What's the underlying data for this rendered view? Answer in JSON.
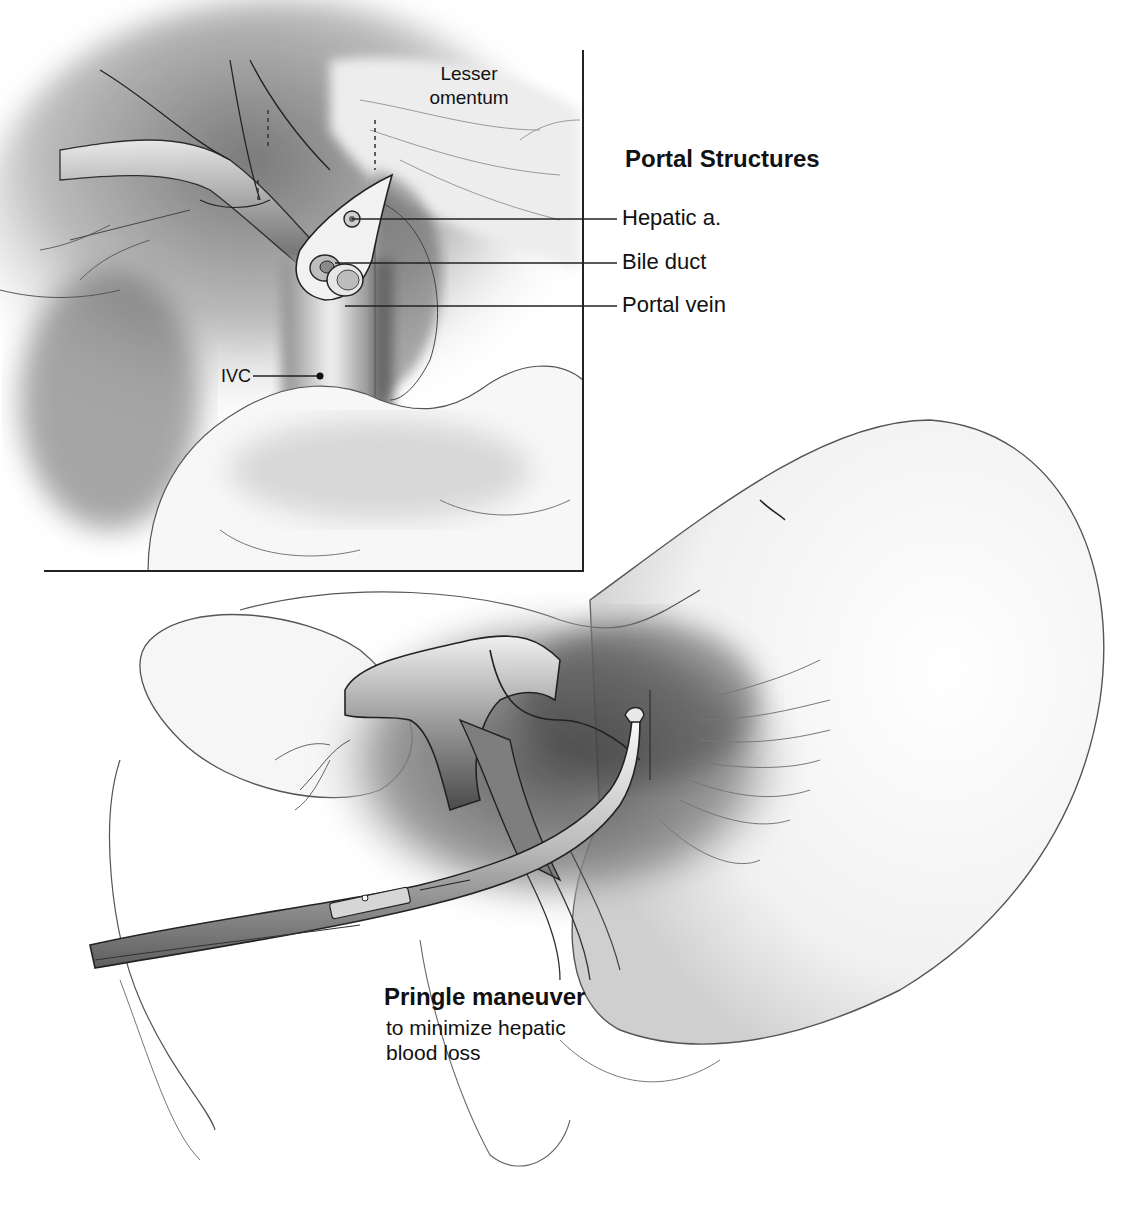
{
  "figure": {
    "inset": {
      "title": "Portal Structures",
      "labels": {
        "lesser_omentum_line1": "Lesser",
        "lesser_omentum_line2": "omentum",
        "hepatic_artery": "Hepatic a.",
        "bile_duct": "Bile duct",
        "portal_vein": "Portal vein",
        "ivc": "IVC"
      }
    },
    "main": {
      "title": "Pringle maneuver",
      "caption_line1": "to minimize hepatic",
      "caption_line2": "blood loss"
    },
    "colors": {
      "background": "#ffffff",
      "ink": "#111111",
      "shade_dark": "#4a4a4a",
      "shade_mid": "#9a9a9a",
      "shade_light": "#e6e6e6"
    }
  }
}
